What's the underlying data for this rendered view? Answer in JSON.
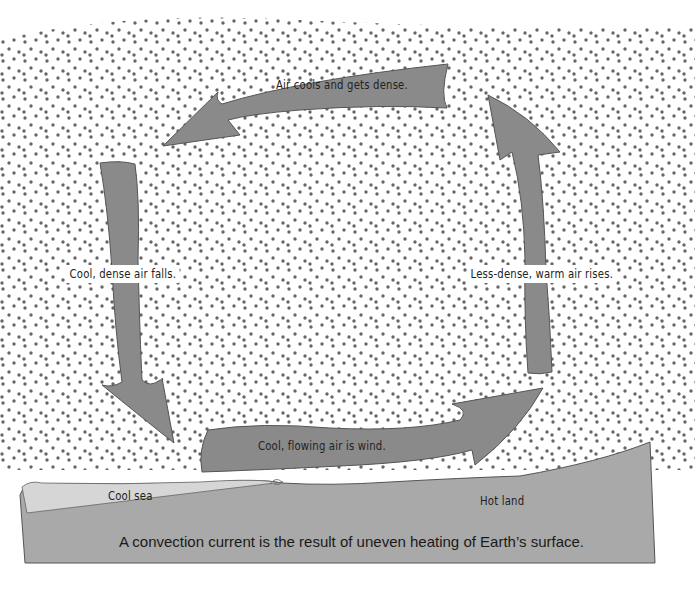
{
  "diagram": {
    "colors": {
      "arrow_fill": "#8a8a8a",
      "arrow_stroke": "#555555",
      "dot": "#666666",
      "sea": "#d4d4d4",
      "land": "#a9a9a9",
      "background": "#ffffff"
    },
    "arrows": [
      {
        "id": "top",
        "label": "Air cools and gets dense.",
        "direction": "left"
      },
      {
        "id": "left",
        "label": "Cool, dense air falls.",
        "direction": "down"
      },
      {
        "id": "bottom",
        "label": "Cool, flowing air is wind.",
        "direction": "right"
      },
      {
        "id": "right",
        "label": "Less-dense, warm air rises.",
        "direction": "up"
      }
    ],
    "surface": {
      "sea_label": "Cool sea",
      "land_label": "Hot land"
    },
    "caption": "A convection current is the result of uneven heating of Earth’s surface."
  }
}
